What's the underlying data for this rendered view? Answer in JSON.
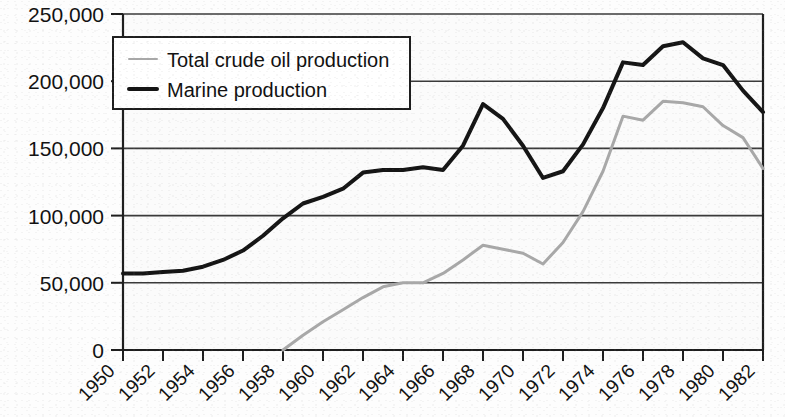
{
  "chart_data": {
    "type": "line",
    "title": "",
    "subtitle": "",
    "xlabel": "",
    "ylabel": "",
    "grid": true,
    "legend_position": "top-left-inside",
    "xlim": [
      1950,
      1982
    ],
    "ylim": [
      0,
      250000
    ],
    "ytick_step": 50000,
    "xtick_step": 2,
    "ytick_labels": [
      "250,000",
      "200,000",
      "150,000",
      "100,000",
      "50,000",
      "0"
    ],
    "ytick_values": [
      250000,
      200000,
      150000,
      100000,
      50000,
      0
    ],
    "xtick_labels": [
      "1950",
      "1952",
      "1954",
      "1956",
      "1958",
      "1960",
      "1962",
      "1964",
      "1966",
      "1968",
      "1970",
      "1972",
      "1974",
      "1976",
      "1978",
      "1980",
      "1982"
    ],
    "xtick_values": [
      1950,
      1952,
      1954,
      1956,
      1958,
      1960,
      1962,
      1964,
      1966,
      1968,
      1970,
      1972,
      1974,
      1976,
      1978,
      1980,
      1982
    ],
    "x": [
      1950,
      1951,
      1952,
      1953,
      1954,
      1955,
      1956,
      1957,
      1958,
      1959,
      1960,
      1961,
      1962,
      1963,
      1964,
      1965,
      1966,
      1967,
      1968,
      1969,
      1970,
      1971,
      1972,
      1973,
      1974,
      1975,
      1976,
      1977,
      1978,
      1979,
      1980,
      1981,
      1982
    ],
    "series": [
      {
        "name": "Total crude oil production",
        "color": "#a8a8a8",
        "width": 3,
        "values": [
          null,
          null,
          null,
          null,
          null,
          null,
          null,
          null,
          0,
          11000,
          21000,
          30000,
          39000,
          47000,
          50000,
          50000,
          57000,
          67000,
          78000,
          75000,
          72000,
          64000,
          80000,
          103000,
          133000,
          174000,
          171000,
          185000,
          184000,
          181000,
          167000,
          158000,
          135000
        ]
      },
      {
        "name": "Marine production",
        "color": "#151515",
        "width": 4,
        "values": [
          57000,
          57000,
          58000,
          59000,
          62000,
          67000,
          74000,
          85000,
          98000,
          109000,
          114000,
          120000,
          132000,
          134000,
          134000,
          136000,
          134000,
          152000,
          183000,
          172000,
          152000,
          128000,
          133000,
          153000,
          180000,
          214000,
          212000,
          226000,
          229000,
          217000,
          212000,
          193000,
          177000
        ]
      }
    ]
  },
  "legend": {
    "items": [
      {
        "label": "Total crude oil production",
        "color": "#a8a8a8",
        "style": "thin"
      },
      {
        "label": "Marine production",
        "color": "#151515",
        "style": "thick"
      }
    ]
  },
  "axes": {
    "y_axis_name": "value-axis",
    "x_axis_name": "year-axis"
  }
}
